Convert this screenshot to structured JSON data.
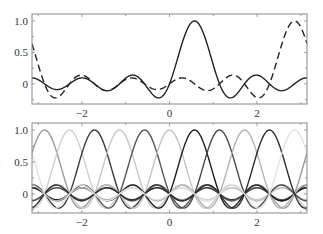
{
  "chart_data": [
    {
      "type": "line",
      "title": "",
      "xlabel": "",
      "ylabel": "",
      "description": "Periodic sinc (Dirichlet) cardinal functions, N=11, sin(N(x-c)/2)/(N sin((x-c)/2))",
      "N": 11,
      "xlim": [
        -3.14159,
        3.14159
      ],
      "ylim": [
        -0.32,
        1.11
      ],
      "grid": false,
      "legend": null,
      "x_ticks": [
        -2,
        0,
        2
      ],
      "x_tick_labels": [
        "−2",
        "0",
        "2"
      ],
      "y_ticks": [
        0,
        0.5,
        1.0
      ],
      "y_tick_labels": [
        "0",
        "0.5",
        "1.0"
      ],
      "series": [
        {
          "name": "cardinal k=1",
          "center": 0.5712,
          "style": "solid",
          "color": "#222222",
          "peak": 1.0
        },
        {
          "name": "cardinal k=5",
          "center": 2.856,
          "style": "dashed",
          "color": "#222222",
          "peak": 1.0
        }
      ]
    },
    {
      "type": "line",
      "title": "",
      "xlabel": "",
      "ylabel": "",
      "description": "All 11 periodic sinc cardinal functions in varying gray levels",
      "N": 11,
      "xlim": [
        -3.14159,
        3.14159
      ],
      "ylim": [
        -0.3,
        1.11
      ],
      "grid": false,
      "legend": null,
      "x_ticks": [
        -2,
        0,
        2
      ],
      "x_tick_labels": [
        "−2",
        "0",
        "2"
      ],
      "y_ticks": [
        0,
        0.5,
        1.0
      ],
      "y_tick_labels": [
        "0",
        "0.5",
        "1.0"
      ],
      "series": [
        {
          "name": "k=-5",
          "center": -2.856,
          "style": "solid",
          "color": "#9a9a9a",
          "peak": 1.0
        },
        {
          "name": "k=-4",
          "center": -2.2848,
          "style": "solid",
          "color": "#d0d0d0",
          "peak": 1.0
        },
        {
          "name": "k=-3",
          "center": -1.7136,
          "style": "solid",
          "color": "#3a3a3a",
          "peak": 1.0
        },
        {
          "name": "k=-2",
          "center": -1.1424,
          "style": "solid",
          "color": "#c8c8c8",
          "peak": 1.0
        },
        {
          "name": "k=-1",
          "center": -0.5712,
          "style": "solid",
          "color": "#555555",
          "peak": 1.0
        },
        {
          "name": "k=0",
          "center": 0.0,
          "style": "solid",
          "color": "#c4c4c4",
          "peak": 1.0
        },
        {
          "name": "k=1",
          "center": 0.5712,
          "style": "solid",
          "color": "#1e1e1e",
          "peak": 1.0
        },
        {
          "name": "k=2",
          "center": 1.1424,
          "style": "solid",
          "color": "#4a4a4a",
          "peak": 1.0
        },
        {
          "name": "k=3",
          "center": 1.7136,
          "style": "solid",
          "color": "#b4b4b4",
          "peak": 1.0
        },
        {
          "name": "k=4",
          "center": 2.2848,
          "style": "solid",
          "color": "#2e2e2e",
          "peak": 1.0
        },
        {
          "name": "k=5",
          "center": 2.856,
          "style": "solid",
          "color": "#e2e2e2",
          "peak": 1.0
        }
      ]
    }
  ],
  "panels": [
    {
      "left": 32,
      "top": 14,
      "right": 307,
      "bottom": 104
    },
    {
      "left": 32,
      "top": 123,
      "right": 307,
      "bottom": 213
    }
  ]
}
